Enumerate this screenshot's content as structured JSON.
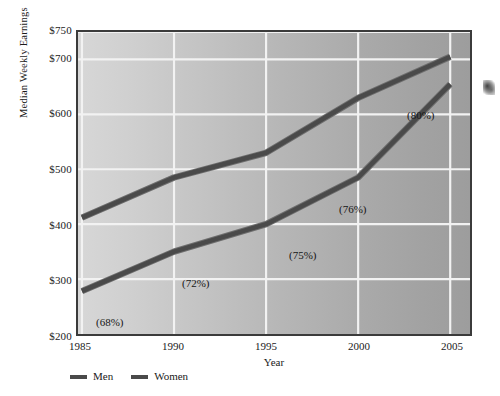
{
  "chart_data": {
    "type": "line",
    "title": "",
    "xlabel": "Year",
    "ylabel": "Median Weekly Earnings",
    "x": [
      1985,
      1990,
      1995,
      2000,
      2005
    ],
    "x_tick_labels": [
      "1985",
      "1990",
      "1995",
      "2000",
      "2005"
    ],
    "y_tick_labels": [
      "$750",
      "$700",
      "$600",
      "$500",
      "$400",
      "$300",
      "$200"
    ],
    "y_ticks": [
      750,
      700,
      600,
      500,
      400,
      300,
      200
    ],
    "xlim": [
      1985,
      2005
    ],
    "ylim": [
      200,
      750
    ],
    "grid": true,
    "legend_position": "below-left",
    "series": [
      {
        "name": "Men",
        "color": "#4a4a4a",
        "values": [
          412,
          485,
          530,
          630,
          705
        ]
      },
      {
        "name": "Women",
        "color": "#4a4a4a",
        "values": [
          278,
          350,
          400,
          485,
          655
        ]
      }
    ],
    "annotations": [
      {
        "text": "(68%)",
        "x": 1985,
        "y": 278,
        "dx": 14,
        "dy": 22
      },
      {
        "text": "(72%)",
        "x": 1990,
        "y": 350,
        "dx": 7,
        "dy": 23
      },
      {
        "text": "(75%)",
        "x": 1995,
        "y": 400,
        "dx": 21,
        "dy": 23
      },
      {
        "text": "(76%)",
        "x": 2000,
        "y": 485,
        "dx": -22,
        "dy": 25
      },
      {
        "text": "(80%)",
        "x": 2005,
        "y": 655,
        "dx": -47,
        "dy": 25
      }
    ]
  },
  "axes": {
    "y_title": "Median Weekly Earnings",
    "x_title": "Year",
    "y_ticks": [
      {
        "label": "$750"
      },
      {
        "label": "$700"
      },
      {
        "label": "$600"
      },
      {
        "label": "$500"
      },
      {
        "label": "$400"
      },
      {
        "label": "$300"
      },
      {
        "label": "$200"
      }
    ],
    "x_ticks": [
      {
        "label": "1985"
      },
      {
        "label": "1990"
      },
      {
        "label": "1995"
      },
      {
        "label": "2000"
      },
      {
        "label": "2005"
      }
    ]
  },
  "legend": {
    "items": [
      {
        "label": "Men",
        "color": "#4a4a4a"
      },
      {
        "label": "Women",
        "color": "#4a4a4a"
      }
    ]
  },
  "colors": {
    "line": "#4a4a4a",
    "line_highlight": "#6e6e6e",
    "gridline": "#f2f2f2",
    "frame": "#3b3b3b",
    "plot_bg_left": "#d7d7d7",
    "plot_bg_right": "#9d9d9d",
    "page_bg": "#ffffff",
    "text": "#1a1a1a"
  }
}
